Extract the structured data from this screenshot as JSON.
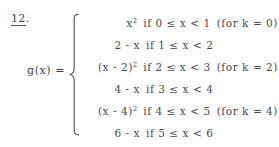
{
  "problem": {
    "number": "12",
    "period": "."
  },
  "function": {
    "label": "g(x)  =",
    "name": "g",
    "variable": "x"
  },
  "brace": {
    "type": "large-left-brace"
  },
  "cases": [
    {
      "expression": "x²",
      "expr_base": "x",
      "expr_sup": "2",
      "condition": "if 0  ≤  x  <  1",
      "note": "(for  k  =  0)",
      "k": "0",
      "lower": "0",
      "upper": "1"
    },
    {
      "expression": "2  -  x",
      "expr_base": "2  -  x",
      "expr_sup": "",
      "condition": "if 1  ≤  x  <  2",
      "note": "",
      "k": "",
      "lower": "1",
      "upper": "2"
    },
    {
      "expression": "(x  -  2)²",
      "expr_base": "(x  -  2)",
      "expr_sup": "2",
      "condition": "if 2  ≤  x  <  3",
      "note": "(for  k  =  2)",
      "k": "2",
      "lower": "2",
      "upper": "3"
    },
    {
      "expression": "4  -  x",
      "expr_base": "4  -  x",
      "expr_sup": "",
      "condition": "if 3  ≤  x  <  4",
      "note": "",
      "k": "",
      "lower": "3",
      "upper": "4"
    },
    {
      "expression": "(x  -  4)²",
      "expr_base": "(x  -  4)",
      "expr_sup": "2",
      "condition": "if 4  ≤  x  <  5",
      "note": "(for  k  =  4)",
      "k": "4",
      "lower": "4",
      "upper": "5"
    },
    {
      "expression": "6  -  x",
      "expr_base": "6  -  x",
      "expr_sup": "",
      "condition": "if 5  ≤  x  <  6",
      "note": "",
      "k": "",
      "lower": "5",
      "upper": "6"
    }
  ],
  "colors": {
    "background": "#ffffff",
    "text": "#4a4a4a",
    "rule": "#575757"
  }
}
